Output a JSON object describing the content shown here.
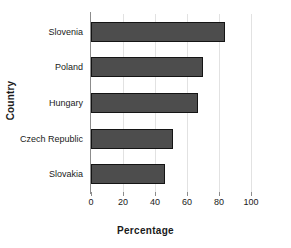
{
  "chart_data": {
    "type": "bar",
    "orientation": "horizontal",
    "title": "",
    "xlabel": "Percentage",
    "ylabel": "Country",
    "categories": [
      "Slovenia",
      "Poland",
      "Hungary",
      "Czech Republic",
      "Slovakia"
    ],
    "values": [
      84,
      70,
      67,
      51,
      46
    ],
    "xlim": [
      0,
      100
    ],
    "xticks": [
      0,
      20,
      40,
      60,
      80,
      100
    ],
    "xtick_labels": [
      "0",
      "20",
      "40",
      "60",
      "80",
      "100"
    ],
    "grid": true,
    "legend": false,
    "bar_color": "#4d4d4d",
    "bar_border_color": "#141414",
    "axis_color": "#8c8c8c",
    "gridline_color": "#e2e2e2",
    "background": "#ffffff"
  }
}
